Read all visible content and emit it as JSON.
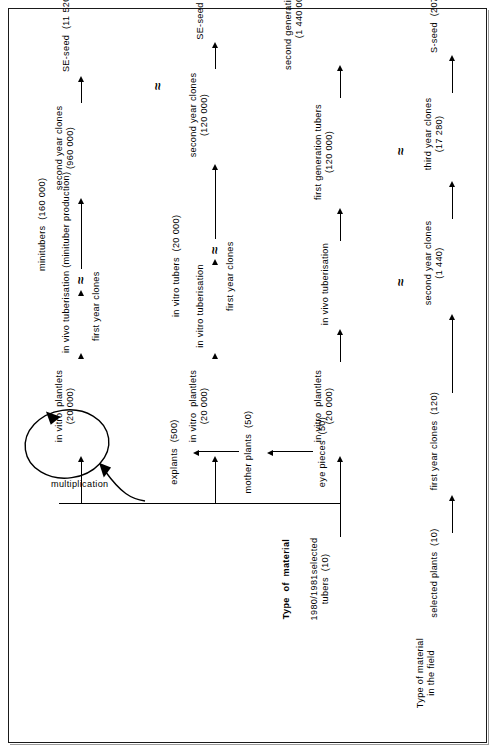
{
  "figure": {
    "kind": "flow-diagram",
    "orientation": "rotated-90-counterclockwise",
    "frame": true,
    "ink_color": "#000000",
    "background_color": "#ffffff"
  },
  "headings": {
    "field_material": "Type of material\nin the field",
    "lab_material": "Type  of  material"
  },
  "chains": {
    "field_chain": {
      "name": "field-multiplication-chain",
      "nodes": [
        "selected plants  (10)",
        "first year clones  (120)",
        "second year clones\n(1 440)",
        "third year clones\n(17 280)",
        "S-seed  (207 360)"
      ]
    },
    "stock_chain": {
      "name": "in-vitro-stock-chain",
      "nodes": [
        "1980/1981selected\ntubers  (10)",
        "eye pieces  (50)",
        "mother plants  (50)",
        "explants  (500)"
      ],
      "loop_label": "multiplication"
    },
    "branch_invivo": {
      "name": "in-vivo-tuberisation-branch",
      "nodes": [
        "in vitro  plantlets\n(20 000)",
        "in vivo tuberisation",
        "first generation tubers\n(120 000)",
        "second generation  tubers\n(1 440 000)",
        "S-seed  (17 280 000)"
      ]
    },
    "branch_invitro": {
      "name": "in-vitro-tuberisation-branch",
      "nodes": [
        "in vitro  plantlets\n(20 000)",
        "in vitro tuberisation",
        "in vitro tubers  (20 000)",
        "first year clones",
        "second year clones\n(120 000)",
        "SE-seed  (1 440 000)"
      ]
    },
    "branch_minituber": {
      "name": "minituber-production-branch",
      "nodes": [
        "in vitro  plantlets\n(20 000)",
        "in vivo tuberisation (minituber production)",
        "minitubers  (160 000)",
        "first year clones",
        "second year clones\n(960 000)",
        "SE-seed  (11 520 000)"
      ]
    }
  },
  "symbols": {
    "approx": "≈"
  }
}
